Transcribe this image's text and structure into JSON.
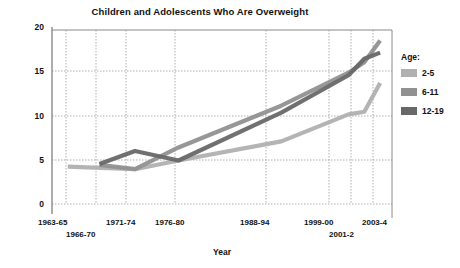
{
  "chart_data": {
    "type": "line",
    "title": "Children and Adolescents Who Are Overweight",
    "xlabel": "Year",
    "ylabel": "Percent",
    "ylim": [
      0,
      20
    ],
    "yticks": [
      0,
      5,
      10,
      15,
      20
    ],
    "grid": true,
    "legend_position": "right",
    "legend_title": "Age:",
    "categories": [
      "1963-65",
      "1966-70",
      "1971-74",
      "1976-80",
      "1988-94",
      "1999-00",
      "2001-2",
      "2003-4"
    ],
    "x": [
      1964,
      1968,
      1972.5,
      1978,
      1991,
      1999.5,
      2001.5,
      2003.5
    ],
    "xlim": [
      1962,
      2005
    ],
    "series": [
      {
        "name": "2-5",
        "color": "#b0b0b0",
        "x": [
          1964,
          1972.5,
          1978,
          1991,
          1999.5,
          2001.5,
          2003.5
        ],
        "values": [
          4.3,
          4.0,
          5.0,
          7.2,
          10.3,
          10.6,
          13.9
        ]
      },
      {
        "name": "6-11",
        "color": "#919191",
        "x": [
          1968,
          1972.5,
          1978,
          1991,
          1999.5,
          2001.5,
          2003.5
        ],
        "values": [
          4.5,
          4.0,
          6.5,
          11.3,
          15.1,
          16.3,
          18.8
        ]
      },
      {
        "name": "12-19",
        "color": "#686868",
        "x": [
          1968,
          1972.5,
          1978,
          1991,
          1999.5,
          2001.5,
          2003.5
        ],
        "values": [
          4.6,
          6.1,
          5.0,
          10.5,
          14.8,
          16.7,
          17.4
        ]
      }
    ]
  },
  "axes": {
    "yticks": [
      {
        "label": "20",
        "top": 27
      },
      {
        "label": "15",
        "top": 71
      },
      {
        "label": "10",
        "top": 116
      },
      {
        "label": "5",
        "top": 160
      },
      {
        "label": "0",
        "top": 204
      }
    ],
    "xticks": [
      {
        "label": "1963-65",
        "left": 38,
        "top": 218
      },
      {
        "label": "1966-70",
        "left": 66,
        "top": 230
      },
      {
        "label": "1971-74",
        "left": 106,
        "top": 218
      },
      {
        "label": "1976-80",
        "left": 155,
        "top": 218
      },
      {
        "label": "1988-94",
        "left": 240,
        "top": 218
      },
      {
        "label": "1999-00",
        "left": 304,
        "top": 218
      },
      {
        "label": "2001-2",
        "left": 329,
        "top": 230
      },
      {
        "label": "2003-4",
        "left": 362,
        "top": 218
      }
    ],
    "gridlines_x": [
      66,
      96,
      126,
      175,
      266,
      329,
      351,
      373
    ],
    "gridlines_y": [
      71,
      116,
      160,
      204
    ]
  },
  "legend": {
    "title": "Age:",
    "items": [
      {
        "label": "2-5",
        "color": "#b0b0b0"
      },
      {
        "label": "6-11",
        "color": "#919191"
      },
      {
        "label": "12-19",
        "color": "#686868"
      }
    ]
  },
  "colors": {
    "axis": "#8a8a8a",
    "grid": "#9a9a9a",
    "text": "#111111",
    "background": "#ffffff"
  }
}
